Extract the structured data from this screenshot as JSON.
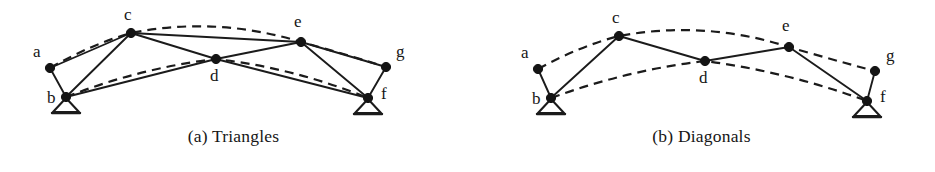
{
  "figure": {
    "background_color": "#ffffff",
    "ink_color": "#1b1b1b",
    "node_color": "#141414",
    "panels": [
      {
        "id": "a",
        "caption": "(a) Triangles",
        "nodes": [
          {
            "id": "a",
            "label": "a",
            "x": 50,
            "y": 68,
            "label_x": 33,
            "label_y": 57
          },
          {
            "id": "b",
            "label": "b",
            "x": 66,
            "y": 97,
            "label_x": 47,
            "label_y": 103
          },
          {
            "id": "c",
            "label": "c",
            "x": 131,
            "y": 33,
            "label_x": 124,
            "label_y": 20
          },
          {
            "id": "d",
            "label": "d",
            "x": 216,
            "y": 59,
            "label_x": 210,
            "label_y": 81
          },
          {
            "id": "e",
            "label": "e",
            "x": 301,
            "y": 42,
            "label_x": 294,
            "label_y": 27
          },
          {
            "id": "f",
            "label": "f",
            "x": 368,
            "y": 98,
            "label_x": 381,
            "label_y": 99
          },
          {
            "id": "g",
            "label": "g",
            "x": 386,
            "y": 67,
            "label_x": 396,
            "label_y": 57
          }
        ],
        "members": [
          {
            "from": "a",
            "to": "b"
          },
          {
            "from": "a",
            "to": "c"
          },
          {
            "from": "b",
            "to": "c"
          },
          {
            "from": "b",
            "to": "d"
          },
          {
            "from": "c",
            "to": "d"
          },
          {
            "from": "c",
            "to": "e"
          },
          {
            "from": "d",
            "to": "e"
          },
          {
            "from": "d",
            "to": "f"
          },
          {
            "from": "e",
            "to": "f"
          },
          {
            "from": "e",
            "to": "g"
          },
          {
            "from": "f",
            "to": "g"
          }
        ],
        "cables": [
          {
            "name": "upper-cable",
            "path": "M 50 68 Q 92 44 131 33 Q 216 16 301 42 Q 345 54 386 67"
          },
          {
            "name": "lower-cable",
            "path": "M 66 97 Q 140 68 216 59 Q 294 68 368 98"
          }
        ],
        "supports": [
          {
            "node": "b",
            "half_width": 13,
            "height": 15
          },
          {
            "node": "f",
            "half_width": 13,
            "height": 15
          }
        ]
      },
      {
        "id": "b",
        "caption": "(b) Diagonals",
        "nodes": [
          {
            "id": "a",
            "label": "a",
            "x": 70,
            "y": 69,
            "label_x": 53,
            "label_y": 58
          },
          {
            "id": "b",
            "label": "b",
            "x": 83,
            "y": 98,
            "label_x": 64,
            "label_y": 104
          },
          {
            "id": "c",
            "label": "c",
            "x": 151,
            "y": 36,
            "label_x": 144,
            "label_y": 23
          },
          {
            "id": "d",
            "label": "d",
            "x": 237,
            "y": 61,
            "label_x": 231,
            "label_y": 83
          },
          {
            "id": "e",
            "label": "e",
            "x": 321,
            "y": 47,
            "label_x": 314,
            "label_y": 31
          },
          {
            "id": "f",
            "label": "f",
            "x": 399,
            "y": 101,
            "label_x": 412,
            "label_y": 102
          },
          {
            "id": "g",
            "label": "g",
            "x": 407,
            "y": 71,
            "label_x": 418,
            "label_y": 61
          }
        ],
        "members": [
          {
            "from": "a",
            "to": "b"
          },
          {
            "from": "b",
            "to": "c"
          },
          {
            "from": "c",
            "to": "d"
          },
          {
            "from": "d",
            "to": "e"
          },
          {
            "from": "e",
            "to": "f"
          },
          {
            "from": "f",
            "to": "g"
          }
        ],
        "cables": [
          {
            "name": "upper-cable",
            "path": "M 70 69 Q 112 46 151 36 Q 237 20 321 47 Q 365 60 407 71"
          },
          {
            "name": "lower-cable",
            "path": "M 83 98 Q 160 70 237 61 Q 320 72 399 101"
          }
        ],
        "supports": [
          {
            "node": "b",
            "half_width": 13,
            "height": 15
          },
          {
            "node": "f",
            "half_width": 13,
            "height": 15
          }
        ]
      }
    ],
    "style": {
      "member_stroke_width": 1.9,
      "cable_stroke_width": 2.2,
      "cable_dash": "9 6",
      "node_radius": 4.6,
      "label_font_size": 17
    }
  }
}
